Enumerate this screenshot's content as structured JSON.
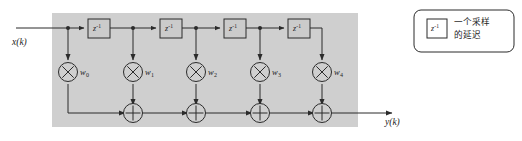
{
  "figure": {
    "kind": "fir-transversal-filter-block-diagram",
    "panel_color": "#cfcfcf",
    "line_color": "#2b2b2b",
    "block_fill": "#cbcbcb",
    "page_background": "#ffffff",
    "input": {
      "label": "x(k)",
      "name": "input-signal"
    },
    "output": {
      "label": "y(k)",
      "name": "output-signal"
    },
    "delay_label": {
      "base": "z",
      "exponent": "-1",
      "full": "z-1"
    },
    "delays": [
      {
        "id": "delay-1",
        "label_base": "z",
        "label_exp": "-1",
        "x": 88,
        "y": 19,
        "w": 22,
        "h": 19
      },
      {
        "id": "delay-2",
        "label_base": "z",
        "label_exp": "-1",
        "x": 160,
        "y": 19,
        "w": 22,
        "h": 19
      },
      {
        "id": "delay-3",
        "label_base": "z",
        "label_exp": "-1",
        "x": 224,
        "y": 19,
        "w": 22,
        "h": 19
      },
      {
        "id": "delay-4",
        "label_base": "z",
        "label_exp": "-1",
        "x": 288,
        "y": 19,
        "w": 22,
        "h": 19
      }
    ],
    "multipliers": [
      {
        "id": "multiplier-0",
        "symbol": "x",
        "weight": "w",
        "subscript": "0",
        "cx": 68,
        "cy": 72
      },
      {
        "id": "multiplier-1",
        "symbol": "x",
        "weight": "w",
        "subscript": "1",
        "cx": 133,
        "cy": 72
      },
      {
        "id": "multiplier-2",
        "symbol": "x",
        "weight": "w",
        "subscript": "2",
        "cx": 196,
        "cy": 72
      },
      {
        "id": "multiplier-3",
        "symbol": "x",
        "weight": "w",
        "subscript": "3",
        "cx": 260,
        "cy": 72
      },
      {
        "id": "multiplier-4",
        "symbol": "x",
        "weight": "w",
        "subscript": "4",
        "cx": 322,
        "cy": 72
      }
    ],
    "adders": [
      {
        "id": "adder-1",
        "symbol": "+",
        "cx": 133,
        "cy": 113
      },
      {
        "id": "adder-2",
        "symbol": "+",
        "cx": 196,
        "cy": 113
      },
      {
        "id": "adder-3",
        "symbol": "+",
        "cx": 260,
        "cy": 113
      },
      {
        "id": "adder-4",
        "symbol": "+",
        "cx": 322,
        "cy": 113
      }
    ],
    "tap_nodes": [
      {
        "id": "tap-node-0",
        "cx": 68,
        "cy": 28
      },
      {
        "id": "tap-node-1",
        "cx": 133,
        "cy": 28
      },
      {
        "id": "tap-node-2",
        "cx": 196,
        "cy": 28
      },
      {
        "id": "tap-node-3",
        "cx": 260,
        "cy": 28
      }
    ],
    "weight_labels": [
      {
        "text": "w",
        "sub": "0",
        "x": 80,
        "y": 68
      },
      {
        "text": "w",
        "sub": "1",
        "x": 145,
        "y": 68
      },
      {
        "text": "w",
        "sub": "2",
        "x": 208,
        "y": 68
      },
      {
        "text": "w",
        "sub": "3",
        "x": 272,
        "y": 68
      },
      {
        "text": "w",
        "sub": "4",
        "x": 334,
        "y": 68
      }
    ]
  },
  "legend": {
    "name": "delay-legend",
    "box_label_base": "z",
    "box_label_exp": "-1",
    "line1": "一个采样",
    "line2": "的延迟"
  }
}
